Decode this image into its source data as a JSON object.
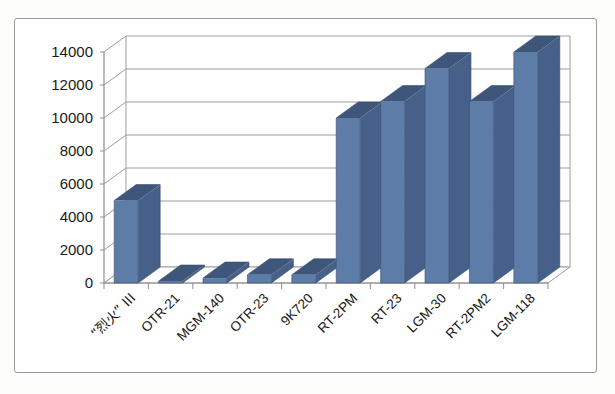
{
  "chart_data": {
    "type": "bar",
    "title": "",
    "subtitle": "",
    "xlabel": "",
    "ylabel": "",
    "categories": [
      "“烈火” III",
      "OTR-21",
      "MGM-140",
      "OTR-23",
      "9K720",
      "RT-2PM",
      "RT-23",
      "LGM-30",
      "RT-2PM2",
      "LGM-118"
    ],
    "values": [
      5000,
      120,
      300,
      500,
      500,
      10000,
      11000,
      13000,
      11000,
      14000
    ],
    "ylim": [
      0,
      14000
    ],
    "ytick_values": [
      0,
      2000,
      4000,
      6000,
      8000,
      10000,
      12000,
      14000
    ],
    "ytick_labels": [
      "0",
      "2000",
      "4000",
      "6000",
      "8000",
      "10000",
      "12000",
      "14000"
    ],
    "grid": true,
    "legend": false,
    "legend_position": "none",
    "style": "3d-column",
    "series": [
      {
        "name": "",
        "values": [
          5000,
          120,
          300,
          500,
          500,
          10000,
          11000,
          13000,
          11000,
          14000
        ]
      }
    ],
    "colors": {
      "bar_front": "#5d7ca8",
      "bar_side": "#46608a",
      "bar_top": "#3e5679",
      "gridline": "#9d9d9d",
      "axis": "#8e8e8e",
      "background": "#ffffff",
      "border": "#9a9a9a",
      "text": "#1a1a1a"
    }
  }
}
